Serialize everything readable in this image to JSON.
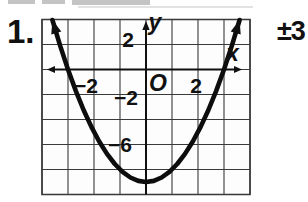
{
  "problem": {
    "number": "1.",
    "answer": "±3"
  },
  "chart_data": {
    "type": "line",
    "title": "",
    "equation": "y = x² − 9",
    "vertex": [
      0,
      -9
    ],
    "x_intercepts": [
      -3,
      3
    ],
    "xlim": [
      -4,
      4
    ],
    "ylim": [
      -10,
      4
    ],
    "grid": true,
    "grid_cells": {
      "cols": 8,
      "rows": 7,
      "origin_col": 4,
      "origin_row": 2,
      "x_units_per_cell": 1,
      "y_units_per_cell": 2
    },
    "xlabel": "x",
    "ylabel": "y",
    "origin_label": "O",
    "x_tick_labels": [
      {
        "value": -2,
        "label": "−2"
      },
      {
        "value": 2,
        "label": "2"
      }
    ],
    "y_tick_labels": [
      {
        "value": 2,
        "label": "2"
      },
      {
        "value": -2,
        "label": "−2"
      },
      {
        "value": -6,
        "label": "−6"
      }
    ],
    "points": [
      [
        -3.6,
        3.96
      ],
      [
        -3.3,
        1.89
      ],
      [
        -3.0,
        0.0
      ],
      [
        -2.7,
        -1.71
      ],
      [
        -2.4,
        -3.24
      ],
      [
        -2.1,
        -4.59
      ],
      [
        -1.8,
        -5.76
      ],
      [
        -1.5,
        -6.75
      ],
      [
        -1.2,
        -7.56
      ],
      [
        -0.9,
        -8.19
      ],
      [
        -0.6,
        -8.64
      ],
      [
        -0.3,
        -8.91
      ],
      [
        0.0,
        -9.0
      ],
      [
        0.3,
        -8.91
      ],
      [
        0.6,
        -8.64
      ],
      [
        0.9,
        -8.19
      ],
      [
        1.2,
        -7.56
      ],
      [
        1.5,
        -6.75
      ],
      [
        1.8,
        -5.76
      ],
      [
        2.1,
        -4.59
      ],
      [
        2.4,
        -3.24
      ],
      [
        2.7,
        -1.71
      ],
      [
        3.0,
        0.0
      ],
      [
        3.3,
        1.89
      ],
      [
        3.6,
        3.96
      ]
    ],
    "legend": null
  }
}
